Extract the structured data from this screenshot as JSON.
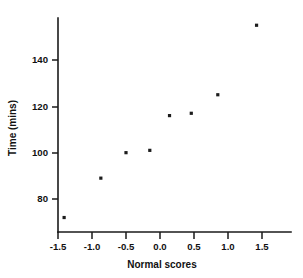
{
  "chart_data": {
    "type": "scatter",
    "title": "",
    "xlabel": "Normal scores",
    "ylabel": "Time (mins)",
    "xlim": [
      -1.75,
      1.62
    ],
    "ylim": [
      66,
      160
    ],
    "grid": false,
    "legend": false,
    "xticks": [
      -1.5,
      -1.0,
      -0.5,
      0.0,
      0.5,
      1.0,
      1.5
    ],
    "xticklabels": [
      "-1.5",
      "-1.0",
      "-0.5",
      "0.0",
      "0.5",
      "1.0",
      "1.5"
    ],
    "yticks": [
      80,
      100,
      120,
      140
    ],
    "yticklabels": [
      "80",
      "100",
      "120",
      "140"
    ],
    "marker": "square",
    "marker_color": "#1c1c1c",
    "marker_size": 3.2,
    "points": [
      {
        "x": -1.41,
        "y": 72
      },
      {
        "x": -0.87,
        "y": 89
      },
      {
        "x": -0.5,
        "y": 100
      },
      {
        "x": -0.15,
        "y": 101
      },
      {
        "x": 0.14,
        "y": 116
      },
      {
        "x": 0.46,
        "y": 117
      },
      {
        "x": 0.85,
        "y": 125
      },
      {
        "x": 1.42,
        "y": 155
      }
    ],
    "x": [
      -1.41,
      -0.87,
      -0.5,
      -0.15,
      0.14,
      0.46,
      0.85,
      1.42
    ],
    "values": [
      72,
      89,
      100,
      101,
      116,
      117,
      125,
      155
    ],
    "axis_color": "#1a1a1a",
    "background_color": "#ffffff"
  }
}
